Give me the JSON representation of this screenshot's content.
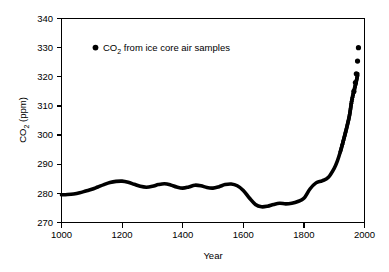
{
  "chart_data": {
    "type": "line",
    "title": "",
    "xlabel": "Year",
    "ylabel": "CO2 (ppm)",
    "ylabel_parts": {
      "main": "CO",
      "sub": "2",
      "unit": " (ppm)"
    },
    "xlim": [
      1000,
      2000
    ],
    "ylim": [
      270,
      340
    ],
    "xticks": [
      1000,
      1200,
      1400,
      1600,
      1800,
      2000
    ],
    "yticks": [
      270,
      280,
      290,
      300,
      310,
      320,
      330,
      340
    ],
    "grid": false,
    "legend_position": "top-left-inside",
    "series": [
      {
        "name": "CO2 from ice core air samples",
        "name_parts": {
          "main": "CO",
          "sub": "2",
          "rest": " from ice core air samples"
        },
        "marker": "dot",
        "color": "#000000",
        "x": [
          1000,
          1020,
          1040,
          1060,
          1080,
          1100,
          1120,
          1140,
          1160,
          1180,
          1200,
          1220,
          1240,
          1260,
          1280,
          1300,
          1320,
          1340,
          1360,
          1380,
          1400,
          1420,
          1440,
          1460,
          1480,
          1500,
          1520,
          1540,
          1560,
          1580,
          1600,
          1620,
          1640,
          1660,
          1680,
          1700,
          1720,
          1740,
          1760,
          1780,
          1800,
          1820,
          1840,
          1860,
          1880,
          1900,
          1910,
          1920,
          1930,
          1940,
          1950,
          1958,
          1965,
          1972,
          1978
        ],
        "y": [
          279.5,
          279.6,
          279.8,
          280.2,
          280.8,
          281.4,
          282.2,
          283.0,
          283.7,
          284.1,
          284.2,
          283.8,
          283.1,
          282.4,
          282.1,
          282.4,
          283.0,
          283.3,
          282.9,
          282.2,
          281.8,
          282.2,
          282.8,
          282.6,
          282.0,
          281.8,
          282.3,
          283.0,
          283.2,
          282.6,
          281.0,
          278.4,
          276.2,
          275.4,
          275.6,
          276.2,
          276.6,
          276.4,
          276.6,
          277.2,
          278.3,
          281.5,
          283.6,
          284.3,
          285.4,
          288.6,
          291.0,
          294.2,
          298.0,
          302.0,
          306.5,
          311.8,
          315.0,
          318.0,
          321.0
        ],
        "isolated_points": [
          {
            "x": 1965,
            "y": 315.0
          },
          {
            "x": 1970,
            "y": 318.0
          },
          {
            "x": 1973,
            "y": 321.0
          },
          {
            "x": 1977,
            "y": 325.4
          },
          {
            "x": 1980,
            "y": 330.0
          }
        ]
      }
    ]
  },
  "axes": {
    "y_title": "CO2 (ppm)",
    "x_title": "Year",
    "y_tick_labels": [
      "340",
      "330",
      "320",
      "310",
      "300",
      "290",
      "280",
      "270"
    ],
    "x_tick_labels": [
      "1000",
      "1200",
      "1400",
      "1600",
      "1800",
      "2000"
    ]
  },
  "legend": {
    "label": "CO2 from ice core air samples",
    "marker": "filled-circle"
  },
  "colors": {
    "background": "#ffffff",
    "foreground": "#000000",
    "series": "#000000"
  }
}
